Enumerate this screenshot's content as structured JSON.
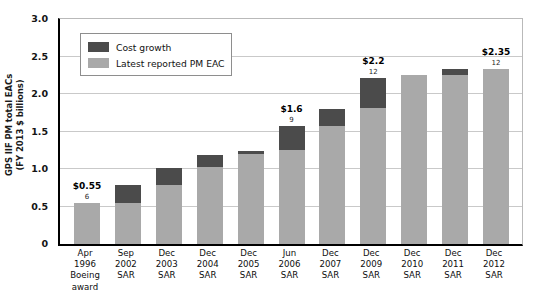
{
  "chart_data": {
    "type": "bar",
    "stacked": true,
    "title": "",
    "xlabel": "",
    "ylabel": "GPS IIF PM total EACs (FY 2013 $ billions)",
    "ylabel_line1": "GPS IIF PM total EACs",
    "ylabel_line2": "(FY 2013 $ billions)",
    "ylim": [
      0,
      3.0
    ],
    "yticks": [
      0,
      0.5,
      1.0,
      1.5,
      2.0,
      2.5,
      3.0
    ],
    "ytick_labels": [
      "0",
      "0.5",
      "1.0",
      "1.5",
      "2.0",
      "2.5",
      "3.0"
    ],
    "grid": true,
    "legend_position": "upper left",
    "categories": [
      "Apr\n1996\nBoeing\naward",
      "Sep\n2002\nSAR",
      "Dec\n2003\nSAR",
      "Dec\n2004\nSAR",
      "Dec\n2005\nSAR",
      "Jun\n2006\nSAR",
      "Dec\n2007\nSAR",
      "Dec\n2009\nSAR",
      "Dec\n2010\nSAR",
      "Dec\n2011\nSAR",
      "Dec\n2012\nSAR"
    ],
    "series": [
      {
        "name": "Latest reported PM EAC",
        "color": "#a9a9a9",
        "values": [
          0.55,
          0.55,
          0.79,
          1.03,
          1.2,
          1.25,
          1.58,
          1.81,
          2.25,
          2.26,
          2.33
        ]
      },
      {
        "name": "Cost growth",
        "color": "#4b4b4b",
        "values": [
          0.0,
          0.24,
          0.23,
          0.16,
          0.04,
          0.32,
          0.22,
          0.41,
          0.0,
          0.07,
          0.0
        ]
      }
    ],
    "totals": [
      0.55,
      0.79,
      1.02,
      1.19,
      1.24,
      1.57,
      1.8,
      2.22,
      2.25,
      2.33,
      2.33
    ],
    "annotations": [
      {
        "index": 0,
        "value_label": "$0.55",
        "count_label": "6"
      },
      {
        "index": 5,
        "value_label": "$1.6",
        "count_label": "9"
      },
      {
        "index": 7,
        "value_label": "$2.2",
        "count_label": "12"
      },
      {
        "index": 10,
        "value_label": "$2.35",
        "count_label": "12"
      }
    ]
  },
  "legend": {
    "items": [
      {
        "label": "Cost growth",
        "color": "#4b4b4b"
      },
      {
        "label": "Latest reported PM EAC",
        "color": "#a9a9a9"
      }
    ]
  }
}
